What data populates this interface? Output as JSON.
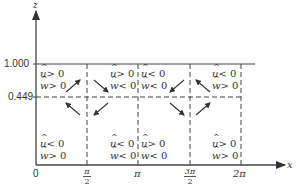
{
  "diagram": {
    "axes": {
      "vertical_label": "z",
      "horizontal_label": "x",
      "y_ticks": [
        "1.000",
        "0.449"
      ],
      "x_ticks": [
        {
          "num": "0",
          "den": ""
        },
        {
          "num": "π",
          "den": "2"
        },
        {
          "num": "π",
          "den": ""
        },
        {
          "num": "3π",
          "den": "2"
        },
        {
          "num": "2π",
          "den": ""
        }
      ]
    },
    "regions": [
      {
        "id": "top-left",
        "u": "> 0",
        "w": "> 0"
      },
      {
        "id": "top-mid-left",
        "u": "> 0",
        "w": "< 0"
      },
      {
        "id": "top-mid-right",
        "u": "< 0",
        "w": "< 0"
      },
      {
        "id": "top-right",
        "u": "< 0",
        "w": "> 0"
      },
      {
        "id": "bottom-left",
        "u": "< 0",
        "w": "> 0"
      },
      {
        "id": "bottom-mid-left",
        "u": "< 0",
        "w": "< 0"
      },
      {
        "id": "bottom-mid-right",
        "u": "> 0",
        "w": "< 0"
      },
      {
        "id": "bottom-right",
        "u": "> 0",
        "w": "> 0"
      }
    ],
    "symbols": {
      "u": "u",
      "w": "w"
    },
    "arrows": [
      {
        "at": "π/2",
        "description": "upper-left arrow pointing up-right toward the π/2 line"
      },
      {
        "at": "π/2",
        "description": "upper-right arrow pointing down-right away from the π/2 line"
      },
      {
        "at": "π/2",
        "description": "lower-left arrow pointing up-left"
      },
      {
        "at": "π/2",
        "description": "lower-right arrow pointing down-left toward the π/2 line"
      },
      {
        "at": "3π/2",
        "description": "upper-left arrow pointing down-left"
      },
      {
        "at": "3π/2",
        "description": "upper-right arrow pointing up-left toward the 3π/2 line"
      },
      {
        "at": "3π/2",
        "description": "lower-left arrow pointing down-right toward the 3π/2 line"
      },
      {
        "at": "3π/2",
        "description": "lower-right arrow pointing up-right"
      }
    ]
  }
}
